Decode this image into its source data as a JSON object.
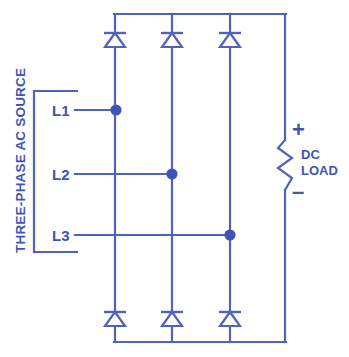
{
  "diagram": {
    "colors": {
      "line": "#5163b8",
      "node": "#3f55b5",
      "text": "#3f55b5",
      "background": "#ffffff"
    },
    "source": {
      "label": "THREE-PHASE AC SOURCE",
      "lines": [
        {
          "name": "L1"
        },
        {
          "name": "L2"
        },
        {
          "name": "L3"
        }
      ]
    },
    "load": {
      "label_line1": "DC",
      "label_line2": "LOAD",
      "polarity_positive": "+",
      "polarity_negative": "–"
    },
    "components": {
      "diode_count": 6,
      "top_diode_label": "diode",
      "bottom_diode_label": "diode",
      "node_count": 3
    }
  }
}
